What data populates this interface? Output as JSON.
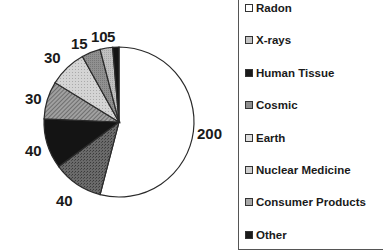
{
  "chart_data": {
    "type": "pie",
    "title": "",
    "start_angle_deg": 0,
    "direction": "clockwise",
    "slices": [
      {
        "label": "Radon",
        "value": 200,
        "display": "200",
        "fill": "#ffffff",
        "pattern": "none"
      },
      {
        "label": "X-rays",
        "value": 40,
        "display": "40",
        "fill": "#5a5a5a",
        "pattern": "stipple"
      },
      {
        "label": "Human Tissue",
        "value": 40,
        "display": "40",
        "fill": "#141414",
        "pattern": "solid"
      },
      {
        "label": "Cosmic",
        "value": 30,
        "display": "30",
        "fill": "#8c8c8c",
        "pattern": "diagonal"
      },
      {
        "label": "Earth",
        "value": 30,
        "display": "30",
        "fill": "#c8c8c8",
        "pattern": "light-dots"
      },
      {
        "label": "Nuclear Medicine",
        "value": 15,
        "display": "15",
        "fill": "#8a8a8a",
        "pattern": "medium"
      },
      {
        "label": "Consumer Products",
        "value": 10,
        "display": "10",
        "fill": "#b8b8b8",
        "pattern": "light"
      },
      {
        "label": "Other",
        "value": 5,
        "display": "5",
        "fill": "#141414",
        "pattern": "solid"
      }
    ],
    "total": 370,
    "legend_position": "right"
  },
  "labels": [
    {
      "text": "200",
      "x": 197,
      "y": 126
    },
    {
      "text": "40",
      "x": 56,
      "y": 193
    },
    {
      "text": "40",
      "x": 25,
      "y": 143
    },
    {
      "text": "30",
      "x": 25,
      "y": 91
    },
    {
      "text": "30",
      "x": 44,
      "y": 50
    },
    {
      "text": "15",
      "x": 71,
      "y": 36
    },
    {
      "text": "10",
      "x": 91,
      "y": 29
    },
    {
      "text": "5",
      "x": 107,
      "y": 29
    }
  ],
  "legend": {
    "items": [
      {
        "label": "Radon",
        "swatch": "#ffffff"
      },
      {
        "label": "X-rays",
        "swatch": "#c4c4c4"
      },
      {
        "label": "Human Tissue",
        "swatch": "#1a1a1a"
      },
      {
        "label": "Cosmic",
        "swatch": "#8e8e8e"
      },
      {
        "label": "Earth",
        "swatch": "#dedede"
      },
      {
        "label": "Nuclear Medicine",
        "swatch": "#cfcfcf"
      },
      {
        "label": "Consumer Products",
        "swatch": "#a8a8a8"
      },
      {
        "label": "Other",
        "swatch": "#1a1a1a"
      }
    ]
  }
}
